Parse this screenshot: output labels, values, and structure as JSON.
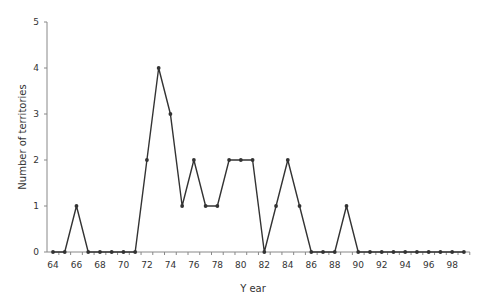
{
  "chart_data": {
    "type": "line",
    "title": "",
    "xlabel": "Y ear",
    "ylabel": "Number of territories",
    "ylim": [
      0,
      5
    ],
    "yticks": [
      0,
      1,
      2,
      3,
      4,
      5
    ],
    "xticks": [
      "64",
      "66",
      "68",
      "70",
      "72",
      "74",
      "76",
      "78",
      "80",
      "82",
      "84",
      "86",
      "88",
      "90",
      "92",
      "94",
      "96",
      "98"
    ],
    "grid": false,
    "legend": null,
    "x": [
      64,
      65,
      66,
      67,
      68,
      69,
      70,
      71,
      72,
      73,
      74,
      75,
      76,
      77,
      78,
      79,
      80,
      81,
      82,
      83,
      84,
      85,
      86,
      87,
      88,
      89,
      90,
      91,
      92,
      93,
      94,
      95,
      96,
      97,
      98,
      99
    ],
    "series": [
      {
        "name": "Number of territories",
        "values": [
          0,
          0,
          1,
          0,
          0,
          0,
          0,
          0,
          2,
          4,
          3,
          1,
          2,
          1,
          1,
          2,
          2,
          2,
          0,
          1,
          2,
          1,
          0,
          0,
          0,
          1,
          0,
          0,
          0,
          0,
          0,
          0,
          0,
          0,
          0,
          0
        ]
      }
    ],
    "colors": {
      "line": "#333333",
      "axis": "#888888"
    }
  }
}
